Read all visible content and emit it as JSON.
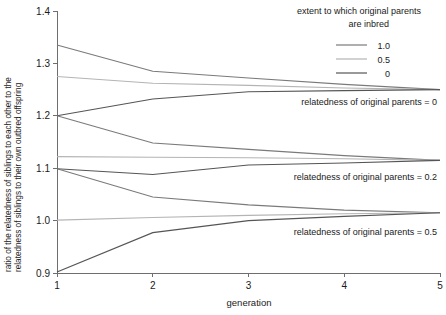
{
  "chart_data": {
    "type": "line",
    "title": "",
    "xlabel": "generation",
    "ylabel_line1": "ratio of the relatedness of siblings to each other to the",
    "ylabel_line2": "relatedness of siblings to their own outbred offspring",
    "x": [
      1,
      2,
      3,
      4,
      5
    ],
    "xlim": [
      1,
      5
    ],
    "ylim": [
      0.9,
      1.4
    ],
    "xticks": [
      "1",
      "2",
      "3",
      "4",
      "5"
    ],
    "yticks": [
      "1.4",
      "1.3",
      "1.2",
      "1.1",
      "1.0",
      "0.9"
    ],
    "grid": false,
    "legend_position": "top-right",
    "legend_title_line1": "extent to which original parents",
    "legend_title_line2": "are inbred",
    "legend": [
      {
        "label": "1.0",
        "color": "#7a7a7a"
      },
      {
        "label": "0.5",
        "color": "#b4b4b4"
      },
      {
        "label": "0",
        "color": "#555555"
      }
    ],
    "groups": [
      {
        "annotation": "relatedness of original parents = 0",
        "series": [
          {
            "name": "1.0",
            "color": "#7a7a7a",
            "values": [
              1.335,
              1.285,
              1.272,
              1.26,
              1.25
            ]
          },
          {
            "name": "0.5",
            "color": "#b4b4b4",
            "values": [
              1.275,
              1.262,
              1.258,
              1.253,
              1.25
            ]
          },
          {
            "name": "0",
            "color": "#555555",
            "values": [
              1.2,
              1.232,
              1.246,
              1.248,
              1.25
            ]
          }
        ]
      },
      {
        "annotation": "relatedness of original parents = 0.2",
        "series": [
          {
            "name": "1.0",
            "color": "#7a7a7a",
            "values": [
              1.2,
              1.148,
              1.136,
              1.124,
              1.115
            ]
          },
          {
            "name": "0.5",
            "color": "#b4b4b4",
            "values": [
              1.122,
              1.121,
              1.12,
              1.118,
              1.115
            ]
          },
          {
            "name": "0",
            "color": "#555555",
            "values": [
              1.099,
              1.088,
              1.106,
              1.11,
              1.115
            ]
          }
        ]
      },
      {
        "annotation": "relatedness of original parents = 0.5",
        "series": [
          {
            "name": "1.0",
            "color": "#7a7a7a",
            "values": [
              1.099,
              1.045,
              1.03,
              1.02,
              1.015
            ]
          },
          {
            "name": "0.5",
            "color": "#b4b4b4",
            "values": [
              1.001,
              1.006,
              1.01,
              1.013,
              1.015
            ]
          },
          {
            "name": "0",
            "color": "#555555",
            "values": [
              0.902,
              0.977,
              1.0,
              1.008,
              1.015
            ]
          }
        ]
      }
    ]
  }
}
